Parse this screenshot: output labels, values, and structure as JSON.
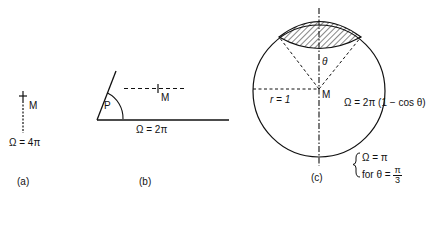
{
  "panels": {
    "a": {
      "caption": "(a)",
      "point_label": "M",
      "formula": "Ω = 4π"
    },
    "b": {
      "caption": "(b)",
      "point_label": "M",
      "vertex_label": "P",
      "formula": "Ω = 2π"
    },
    "c": {
      "caption": "(c)",
      "point_label": "M",
      "angle_label": "θ",
      "radius_label": "r = 1",
      "formula": "Ω = 2π (1 − cos θ)",
      "example": {
        "line1": "Ω = π",
        "line2_prefix": "for  θ =",
        "frac_num": "π",
        "frac_den": "3"
      }
    }
  },
  "colors": {
    "ink": "#111111",
    "background": "#ffffff"
  }
}
